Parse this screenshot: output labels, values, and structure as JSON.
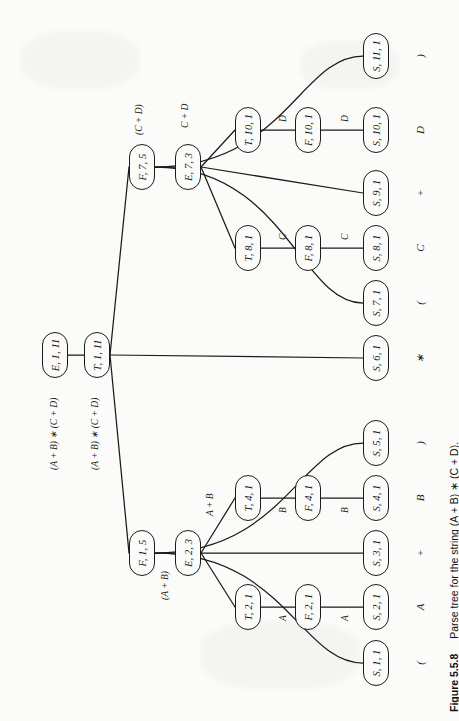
{
  "figure": {
    "number": "Figure 5.5.8",
    "caption": "Parse tree for the string (A + B) ∗ (C + D).",
    "string": "(A + B) ∗ (C + D)",
    "orientation": "rotated-90-ccw",
    "page_bg": "#fbfbf9",
    "ink": "#1b1b1b"
  },
  "nodes": [
    {
      "id": "E_1_11",
      "label": "E, 1, 11",
      "x": 55,
      "y": 355
    },
    {
      "id": "T_1_11",
      "label": "T, 1, 11",
      "x": 97,
      "y": 355
    },
    {
      "id": "F_7_5",
      "label": "F, 7, 5",
      "x": 142,
      "y": 167
    },
    {
      "id": "E_7_3",
      "label": "E, 7, 3",
      "x": 188,
      "y": 167
    },
    {
      "id": "T_10_1",
      "label": "T, 10, 1",
      "x": 248,
      "y": 130
    },
    {
      "id": "F_10_1",
      "label": "F, 10, 1",
      "x": 308,
      "y": 130
    },
    {
      "id": "T_8_1",
      "label": "T, 8, 1",
      "x": 248,
      "y": 248
    },
    {
      "id": "F_8_1",
      "label": "F, 8, 1",
      "x": 308,
      "y": 248
    },
    {
      "id": "F_1_5",
      "label": "F, 1, 5",
      "x": 142,
      "y": 553
    },
    {
      "id": "E_2_3",
      "label": "E, 2, 3",
      "x": 188,
      "y": 553
    },
    {
      "id": "T_4_1",
      "label": "T, 4, 1",
      "x": 248,
      "y": 498
    },
    {
      "id": "F_4_1",
      "label": "F, 4, 1",
      "x": 308,
      "y": 498
    },
    {
      "id": "T_2_1",
      "label": "T, 2, 1",
      "x": 248,
      "y": 607
    },
    {
      "id": "F_2_1",
      "label": "F, 2, 1",
      "x": 308,
      "y": 607
    },
    {
      "id": "S_11_1",
      "label": "S, 11, 1",
      "x": 376,
      "y": 56
    },
    {
      "id": "S_10_1",
      "label": "S, 10, 1",
      "x": 376,
      "y": 130
    },
    {
      "id": "S_9_1",
      "label": "S, 9, 1",
      "x": 376,
      "y": 193
    },
    {
      "id": "S_8_1",
      "label": "S, 8, 1",
      "x": 376,
      "y": 248
    },
    {
      "id": "S_7_1",
      "label": "S, 7, 1",
      "x": 376,
      "y": 303
    },
    {
      "id": "S_6_1",
      "label": "S, 6, 1",
      "x": 376,
      "y": 358
    },
    {
      "id": "S_5_1",
      "label": "S, 5, 1",
      "x": 376,
      "y": 443
    },
    {
      "id": "S_4_1",
      "label": "S, 4, 1",
      "x": 376,
      "y": 498
    },
    {
      "id": "S_3_1",
      "label": "S, 3, 1",
      "x": 376,
      "y": 553
    },
    {
      "id": "S_2_1",
      "label": "S, 2, 1",
      "x": 376,
      "y": 607
    },
    {
      "id": "S_1_1",
      "label": "S, 1, 1",
      "x": 376,
      "y": 663
    }
  ],
  "edges": [
    {
      "from": "E_1_11",
      "to": "T_1_11",
      "kind": "straight"
    },
    {
      "from": "T_1_11",
      "to": "F_7_5",
      "kind": "straight"
    },
    {
      "from": "T_1_11",
      "to": "S_6_1",
      "kind": "straight"
    },
    {
      "from": "T_1_11",
      "to": "F_1_5",
      "kind": "straight"
    },
    {
      "from": "F_7_5",
      "to": "S_11_1",
      "kind": "curve"
    },
    {
      "from": "F_7_5",
      "to": "E_7_3",
      "kind": "straight"
    },
    {
      "from": "F_7_5",
      "to": "S_7_1",
      "kind": "curve"
    },
    {
      "from": "E_7_3",
      "to": "T_10_1",
      "kind": "straight"
    },
    {
      "from": "E_7_3",
      "to": "S_9_1",
      "kind": "straight"
    },
    {
      "from": "E_7_3",
      "to": "T_8_1",
      "kind": "straight"
    },
    {
      "from": "T_10_1",
      "to": "F_10_1",
      "kind": "straight"
    },
    {
      "from": "F_10_1",
      "to": "S_10_1",
      "kind": "straight"
    },
    {
      "from": "T_8_1",
      "to": "F_8_1",
      "kind": "straight"
    },
    {
      "from": "F_8_1",
      "to": "S_8_1",
      "kind": "straight"
    },
    {
      "from": "F_1_5",
      "to": "S_5_1",
      "kind": "curve"
    },
    {
      "from": "F_1_5",
      "to": "E_2_3",
      "kind": "straight"
    },
    {
      "from": "F_1_5",
      "to": "S_1_1",
      "kind": "curve"
    },
    {
      "from": "E_2_3",
      "to": "T_4_1",
      "kind": "straight"
    },
    {
      "from": "E_2_3",
      "to": "S_3_1",
      "kind": "straight"
    },
    {
      "from": "E_2_3",
      "to": "T_2_1",
      "kind": "straight"
    },
    {
      "from": "T_4_1",
      "to": "F_4_1",
      "kind": "straight"
    },
    {
      "from": "F_4_1",
      "to": "S_4_1",
      "kind": "straight"
    },
    {
      "from": "T_2_1",
      "to": "F_2_1",
      "kind": "straight"
    },
    {
      "from": "F_2_1",
      "to": "S_2_1",
      "kind": "straight"
    }
  ],
  "edge_labels": [
    {
      "id": "lbl_root",
      "text": "(A + B) ∗ (C + D)",
      "x": 48,
      "y": 470
    },
    {
      "id": "lbl_t1",
      "text": "(A + B) ∗ (C + D)",
      "x": 89,
      "y": 470
    },
    {
      "id": "lbl_f75",
      "text": "(C + D)",
      "x": 134,
      "y": 135
    },
    {
      "id": "lbl_e73",
      "text": "C + D",
      "x": 180,
      "y": 128
    },
    {
      "id": "lbl_f15",
      "text": "(A + B)",
      "x": 160,
      "y": 600
    },
    {
      "id": "lbl_e23",
      "text": "A + B",
      "x": 205,
      "y": 516
    },
    {
      "id": "lbl_t10_d",
      "text": "D",
      "x": 278,
      "y": 122
    },
    {
      "id": "lbl_f10_d",
      "text": "D",
      "x": 340,
      "y": 122
    },
    {
      "id": "lbl_t8_c",
      "text": "C",
      "x": 278,
      "y": 240
    },
    {
      "id": "lbl_f8_c",
      "text": "C",
      "x": 340,
      "y": 240
    },
    {
      "id": "lbl_t4_b",
      "text": "B",
      "x": 278,
      "y": 513
    },
    {
      "id": "lbl_f4_b",
      "text": "B",
      "x": 340,
      "y": 513
    },
    {
      "id": "lbl_t2_a",
      "text": "A",
      "x": 278,
      "y": 621
    },
    {
      "id": "lbl_f2_a",
      "text": "A",
      "x": 340,
      "y": 621
    }
  ],
  "terminals": [
    {
      "text": ")",
      "x": 420,
      "y": 56
    },
    {
      "text": "D",
      "x": 420,
      "y": 130
    },
    {
      "text": "+",
      "x": 420,
      "y": 193
    },
    {
      "text": "C",
      "x": 420,
      "y": 248
    },
    {
      "text": "(",
      "x": 420,
      "y": 303
    },
    {
      "text": "∗",
      "x": 420,
      "y": 358
    },
    {
      "text": ")",
      "x": 420,
      "y": 443
    },
    {
      "text": "B",
      "x": 420,
      "y": 498
    },
    {
      "text": "+",
      "x": 420,
      "y": 553
    },
    {
      "text": "A",
      "x": 420,
      "y": 607
    },
    {
      "text": "(",
      "x": 420,
      "y": 663
    }
  ]
}
